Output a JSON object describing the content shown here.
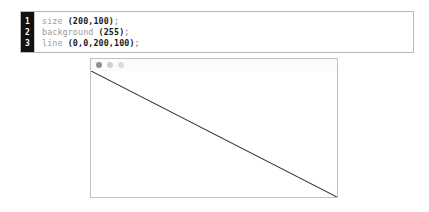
{
  "editor": {
    "line_numbers": [
      "1",
      "2",
      "3"
    ],
    "lines": [
      {
        "fn": "size ",
        "args": "(200,100)",
        "punct": ";"
      },
      {
        "fn": "background ",
        "args": "(255)",
        "punct": ";"
      },
      {
        "fn": "line ",
        "args": "(0,0,200,100)",
        "punct": ";"
      }
    ]
  },
  "sketch_window": {
    "titlebar": {
      "dots": [
        "close-dot",
        "minimize-dot",
        "zoom-dot"
      ],
      "dot_colors": [
        "#8f8f8f",
        "#cfcfcf",
        "#dcdcdc"
      ]
    },
    "canvas": {
      "width": 200,
      "height": 100,
      "background": "255",
      "stroke_color": "#333333",
      "line": {
        "x1": 0,
        "y1": 0,
        "x2": 200,
        "y2": 100
      }
    }
  },
  "colors": {
    "page_background": "#ffffff",
    "panel_border": "#b9b9b9",
    "gutter_background": "#111111",
    "gutter_text": "#ffffff",
    "code_keyword": "#9a9a9a",
    "code_args": "#1b1b1b",
    "window_border": "#c2c2c2"
  }
}
